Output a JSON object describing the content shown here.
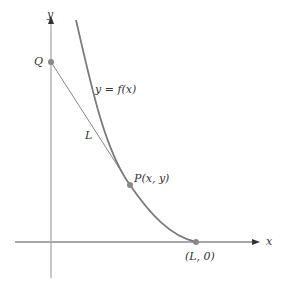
{
  "diagram": {
    "labels": {
      "y_axis": "y",
      "x_axis": "x",
      "q_point": "Q",
      "curve": "y = f(x)",
      "segment": "L",
      "p_point": "P(x, y)",
      "end_point": "(L, 0)"
    },
    "colors": {
      "curve": "#7a7a7a",
      "axis": "#999999",
      "point": "#888888"
    }
  }
}
